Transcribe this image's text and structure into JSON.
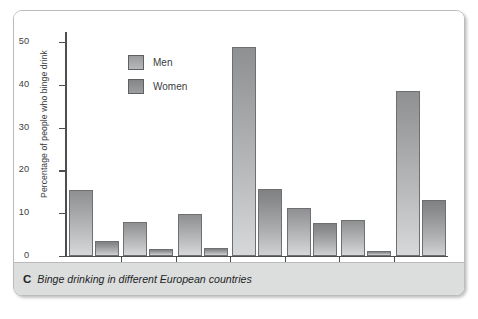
{
  "figure": {
    "caption_letter": "C",
    "caption_text": "Binge drinking in different European countries"
  },
  "chart_data": {
    "type": "bar",
    "title": "Binge drinking in different European countries",
    "xlabel": "",
    "ylabel": "Percentage of people who binge drink",
    "ylim": [
      0,
      50
    ],
    "yticks": [
      0,
      10,
      20,
      30,
      40,
      50
    ],
    "ytick_labels": [
      "0",
      "10",
      "20",
      "30",
      "40",
      "50"
    ],
    "grid": false,
    "legend_position": "upper left inside",
    "categories": [
      "Finland",
      "France",
      "Germany",
      "Ireland",
      "Italy",
      "Sweden",
      "UK"
    ],
    "series": [
      {
        "name": "Men",
        "color": "#a8aaac",
        "values": [
          15.4,
          8.0,
          9.8,
          48.8,
          11.2,
          8.3,
          38.5
        ]
      },
      {
        "name": "Women",
        "color": "#949698",
        "values": [
          3.6,
          1.7,
          1.9,
          15.7,
          7.8,
          1.2,
          13.0
        ]
      }
    ]
  }
}
